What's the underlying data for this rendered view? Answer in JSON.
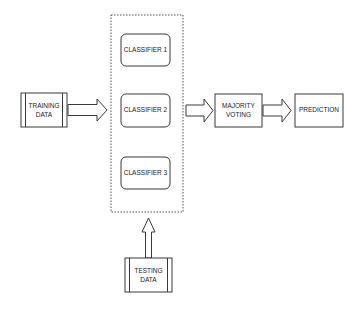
{
  "diagram": {
    "type": "flowchart",
    "nodes": {
      "training_data": {
        "lines": [
          "TRAINING",
          "DATA"
        ],
        "shape": "predefined-process"
      },
      "classifier_1": {
        "lines": [
          "CLASSIFIER 1"
        ],
        "shape": "rounded-rectangle"
      },
      "classifier_2": {
        "lines": [
          "CLASSIFIER 2"
        ],
        "shape": "rounded-rectangle"
      },
      "classifier_3": {
        "lines": [
          "CLASSIFIER 3"
        ],
        "shape": "rounded-rectangle"
      },
      "testing_data": {
        "lines": [
          "TESTING",
          "DATA"
        ],
        "shape": "predefined-process"
      },
      "majority_voting": {
        "lines": [
          "MAJORITY",
          "VOTING"
        ],
        "shape": "rectangle"
      },
      "prediction": {
        "lines": [
          "PREDICTION"
        ],
        "shape": "rectangle"
      }
    },
    "groups": {
      "classifier_ensemble": {
        "members": [
          "classifier_1",
          "classifier_2",
          "classifier_3"
        ],
        "border": "dotted"
      }
    },
    "edges": [
      {
        "from": "training_data",
        "to": "classifier_ensemble",
        "style": "block-arrow"
      },
      {
        "from": "testing_data",
        "to": "classifier_ensemble",
        "style": "block-arrow"
      },
      {
        "from": "classifier_ensemble",
        "to": "majority_voting",
        "style": "block-arrow"
      },
      {
        "from": "majority_voting",
        "to": "prediction",
        "style": "block-arrow"
      }
    ],
    "colors": {
      "stroke": "#3a3a3a",
      "text": "#222222",
      "background": "#ffffff"
    }
  }
}
